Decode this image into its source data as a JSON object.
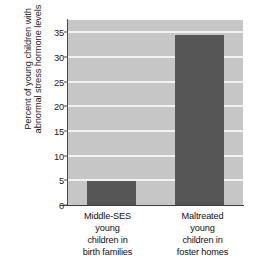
{
  "chart_data": {
    "type": "bar",
    "title": "",
    "xlabel": "",
    "ylabel": "Percent of young children with abnormal stress hormone levels",
    "ylabel_lines": [
      "Percent of young children with",
      "abnormal stress hormone levels"
    ],
    "categories": [
      "Middle-SES young children in birth families",
      "Maltreated young children in foster homes"
    ],
    "category_lines": [
      [
        "Middle-SES",
        "young",
        "children in",
        "birth families"
      ],
      [
        "Maltreated",
        "young",
        "children in",
        "foster homes"
      ]
    ],
    "values": [
      4.8,
      34.5
    ],
    "ylim": [
      0,
      37.5
    ],
    "yticks": [
      0,
      5,
      10,
      15,
      20,
      25,
      30,
      35
    ],
    "ytick_labels": [
      "0",
      "5",
      "10",
      "15",
      "20",
      "25",
      "30",
      "35"
    ],
    "grid": true,
    "legend": "none",
    "colors": {
      "bar": "#565656",
      "plot_background": "#c6c6c6",
      "gridline": "#f2f2f2",
      "axis": "#3d3d3d",
      "text": "#111111"
    }
  }
}
